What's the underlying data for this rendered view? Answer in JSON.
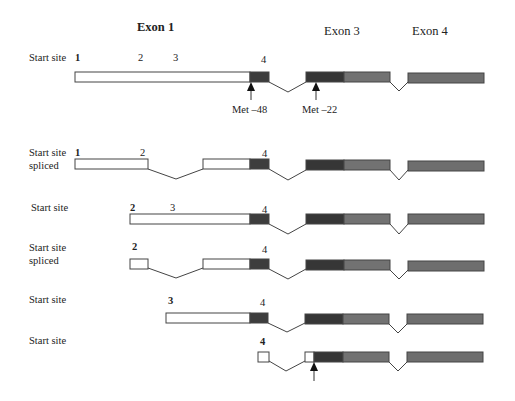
{
  "headers": {
    "exon1": "Exon 1",
    "exon3": "Exon 3",
    "exon4": "Exon 4"
  },
  "met_labels": {
    "met48": "Met –48",
    "met22": "Met –22"
  },
  "colors": {
    "utr_white": "#ffffff",
    "coding_dark": "#3d3d3d",
    "coding_mid": "#5a5a5a",
    "coding_light": "#7a7a7a",
    "outline": "#444444",
    "intron_line": "#444444"
  },
  "rows": [
    {
      "label": "Start site",
      "label2": "",
      "numbers": [
        {
          "t": "1",
          "bold": true,
          "x": 75
        },
        {
          "t": "2",
          "bold": false,
          "x": 140
        },
        {
          "t": "3",
          "bold": false,
          "x": 172
        },
        {
          "t": "4",
          "bold": false,
          "x": 262
        }
      ]
    },
    {
      "label": "Start site",
      "label2": "spliced",
      "numbers": [
        {
          "t": "1",
          "bold": true,
          "x": 75
        },
        {
          "t": "2",
          "bold": false,
          "x": 140
        },
        {
          "t": "4",
          "bold": false,
          "x": 262
        }
      ]
    },
    {
      "label": "Start site",
      "label2": "",
      "numbers": [
        {
          "t": "2",
          "bold": true,
          "x": 130
        },
        {
          "t": "3",
          "bold": false,
          "x": 170
        },
        {
          "t": "4",
          "bold": false,
          "x": 262
        }
      ]
    },
    {
      "label": "Start site",
      "label2": "spliced",
      "numbers": [
        {
          "t": "2",
          "bold": true,
          "x": 132
        },
        {
          "t": "4",
          "bold": false,
          "x": 262
        }
      ]
    },
    {
      "label": "Start site",
      "label2": "",
      "numbers": [
        {
          "t": "3",
          "bold": true,
          "x": 167
        },
        {
          "t": "4",
          "bold": false,
          "x": 260
        }
      ]
    },
    {
      "label": "Start site",
      "label2": "",
      "numbers": [
        {
          "t": "4",
          "bold": true,
          "x": 260
        }
      ]
    }
  ]
}
